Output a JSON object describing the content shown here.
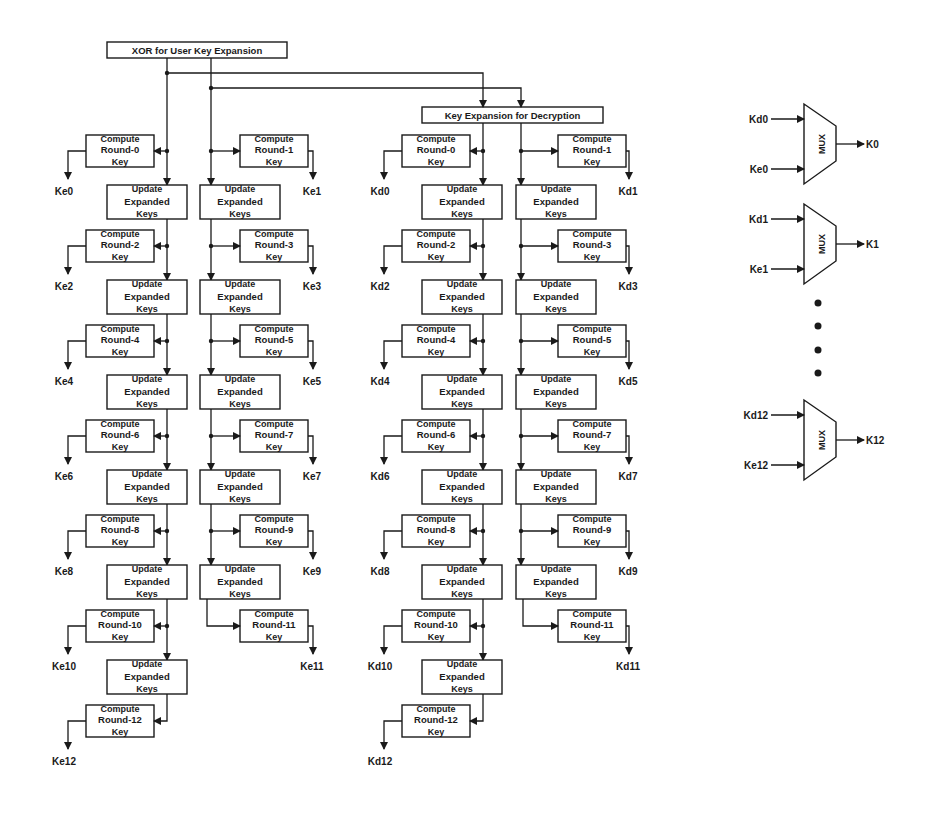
{
  "colors": {
    "ink": "#1a1a1a",
    "background": "#ffffff"
  },
  "top_boxes": {
    "xor": {
      "label": "XOR for User Key Expansion",
      "x": 107,
      "y": 42,
      "w": 180,
      "h": 16
    },
    "decrypt": {
      "label": "Key Expansion for Decryption",
      "x": 422,
      "y": 107,
      "w": 181,
      "h": 16
    }
  },
  "labels": {
    "compute_line1": "Compute",
    "compute_line3": "Key",
    "update_line1": "Update",
    "update_line2": "Expanded",
    "update_line3": "Keys",
    "mux": "MUX"
  },
  "columns": [
    {
      "name": "encryption",
      "prefix": "Ke",
      "stem_left_x": 167,
      "stem_right_x": 211,
      "left_compute_x": 86,
      "right_compute_x": 240,
      "left_update_x": 107,
      "right_update_x": 200,
      "out_left_x": 68,
      "out_right_x": 313,
      "start_y": 58
    },
    {
      "name": "decryption",
      "prefix": "Kd",
      "stem_left_x": 483,
      "stem_right_x": 521,
      "left_compute_x": 402,
      "right_compute_x": 558,
      "left_update_x": 422,
      "right_update_x": 516,
      "out_left_x": 384,
      "out_right_x": 629,
      "start_y": 123
    }
  ],
  "rounds": [
    {
      "round": 0,
      "label": "Round-0",
      "side": "left",
      "y": 135
    },
    {
      "round": 1,
      "label": "Round-1",
      "side": "right",
      "y": 135
    },
    {
      "round": 2,
      "label": "Round-2",
      "side": "left",
      "y": 230
    },
    {
      "round": 3,
      "label": "Round-3",
      "side": "right",
      "y": 230
    },
    {
      "round": 4,
      "label": "Round-4",
      "side": "left",
      "y": 325
    },
    {
      "round": 5,
      "label": "Round-5",
      "side": "right",
      "y": 325
    },
    {
      "round": 6,
      "label": "Round-6",
      "side": "left",
      "y": 420
    },
    {
      "round": 7,
      "label": "Round-7",
      "side": "right",
      "y": 420
    },
    {
      "round": 8,
      "label": "Round-8",
      "side": "left",
      "y": 515
    },
    {
      "round": 9,
      "label": "Round-9",
      "side": "right",
      "y": 515
    },
    {
      "round": 10,
      "label": "Round-10",
      "side": "left",
      "y": 610
    },
    {
      "round": 11,
      "label": "Round-11",
      "side": "right",
      "y": 610
    },
    {
      "round": 12,
      "label": "Round-12",
      "side": "left",
      "y": 705
    }
  ],
  "updates": {
    "left_y": [
      185,
      280,
      375,
      470,
      565,
      660
    ],
    "right_y": [
      185,
      280,
      375,
      470,
      565
    ]
  },
  "muxes": [
    {
      "in_top": "Kd0",
      "in_bottom": "Ke0",
      "out": "K0",
      "y": 104
    },
    {
      "in_top": "Kd1",
      "in_bottom": "Ke1",
      "out": "K1",
      "y": 204
    },
    {
      "in_top": "Kd12",
      "in_bottom": "Ke12",
      "out": "K12",
      "y": 400
    }
  ],
  "ellipsis_dots_y": [
    303,
    326,
    350,
    373
  ],
  "ellipsis_x": 818
}
